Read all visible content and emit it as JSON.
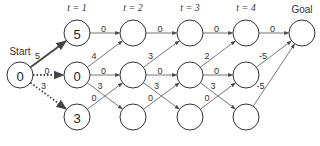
{
  "diagram": {
    "start_label": "Start",
    "goal_label": "Goal",
    "time_labels": [
      "t = 1",
      "t = 2",
      "t = 3",
      "t = 4"
    ],
    "nodes": [
      {
        "id": "start",
        "col": 0,
        "row": 1,
        "value": "0"
      },
      {
        "id": "t1-top",
        "col": 1,
        "row": 0,
        "value": "5"
      },
      {
        "id": "t1-mid",
        "col": 1,
        "row": 1,
        "value": "0"
      },
      {
        "id": "t1-bot",
        "col": 1,
        "row": 2,
        "value": "3"
      },
      {
        "id": "t2-top",
        "col": 2,
        "row": 0,
        "value": ""
      },
      {
        "id": "t2-mid",
        "col": 2,
        "row": 1,
        "value": ""
      },
      {
        "id": "t2-bot",
        "col": 2,
        "row": 2,
        "value": ""
      },
      {
        "id": "t3-top",
        "col": 3,
        "row": 0,
        "value": ""
      },
      {
        "id": "t3-mid",
        "col": 3,
        "row": 1,
        "value": ""
      },
      {
        "id": "t3-bot",
        "col": 3,
        "row": 2,
        "value": ""
      },
      {
        "id": "t4-top",
        "col": 4,
        "row": 0,
        "value": ""
      },
      {
        "id": "t4-mid",
        "col": 4,
        "row": 1,
        "value": ""
      },
      {
        "id": "t4-bot",
        "col": 4,
        "row": 2,
        "value": ""
      },
      {
        "id": "goal",
        "col": 5,
        "row": 0,
        "value": ""
      }
    ],
    "edges": [
      {
        "from": "start",
        "to": "t1-top",
        "weight": "5",
        "style": "bold"
      },
      {
        "from": "start",
        "to": "t1-mid",
        "weight": "0",
        "style": "dotted"
      },
      {
        "from": "start",
        "to": "t1-bot",
        "weight": "3",
        "style": "dotted"
      },
      {
        "from": "t1-top",
        "to": "t2-top",
        "weight": "0",
        "style": "thin"
      },
      {
        "from": "t1-mid",
        "to": "t2-top",
        "weight": "4",
        "style": "thin"
      },
      {
        "from": "t1-mid",
        "to": "t2-mid",
        "weight": "0",
        "style": "thin"
      },
      {
        "from": "t1-mid",
        "to": "t2-bot",
        "weight": "3",
        "style": "thin"
      },
      {
        "from": "t1-bot",
        "to": "t2-mid",
        "weight": "0",
        "style": "thin"
      },
      {
        "from": "t2-top",
        "to": "t3-top",
        "weight": "0",
        "style": "thin"
      },
      {
        "from": "t2-mid",
        "to": "t3-top",
        "weight": "3",
        "style": "thin"
      },
      {
        "from": "t2-mid",
        "to": "t3-mid",
        "weight": "0",
        "style": "thin"
      },
      {
        "from": "t2-mid",
        "to": "t3-bot",
        "weight": "3",
        "style": "thin"
      },
      {
        "from": "t2-bot",
        "to": "t3-mid",
        "weight": "0",
        "style": "thin"
      },
      {
        "from": "t3-top",
        "to": "t4-top",
        "weight": "0",
        "style": "thin"
      },
      {
        "from": "t3-mid",
        "to": "t4-top",
        "weight": "2",
        "style": "thin"
      },
      {
        "from": "t3-mid",
        "to": "t4-mid",
        "weight": "0",
        "style": "thin"
      },
      {
        "from": "t3-mid",
        "to": "t4-bot",
        "weight": "3",
        "style": "thin"
      },
      {
        "from": "t3-bot",
        "to": "t4-mid",
        "weight": "0",
        "style": "thin"
      },
      {
        "from": "t4-top",
        "to": "goal",
        "weight": "0",
        "style": "thin"
      },
      {
        "from": "t4-mid",
        "to": "goal",
        "weight": "-5",
        "style": "thin"
      },
      {
        "from": "t4-bot",
        "to": "goal",
        "weight": "-5",
        "style": "thin"
      }
    ]
  }
}
